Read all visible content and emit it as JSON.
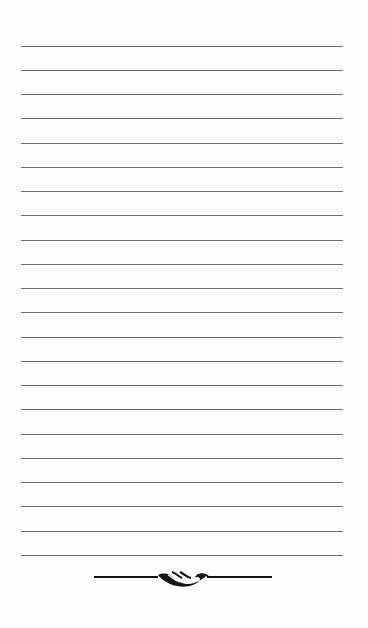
{
  "page": {
    "type": "blank lined writing page",
    "background_color": "#fefefe",
    "rule_color": "#6e6e6e",
    "ornament_color": "#161616",
    "rules": {
      "count": 22,
      "left": 21,
      "right": 343,
      "first_y": 45.7,
      "spacing": 24.25
    },
    "footer_ornament": {
      "icon": "scroll-flourish-divider-icon",
      "left": 94,
      "right": 272,
      "center_y": 577
    }
  }
}
